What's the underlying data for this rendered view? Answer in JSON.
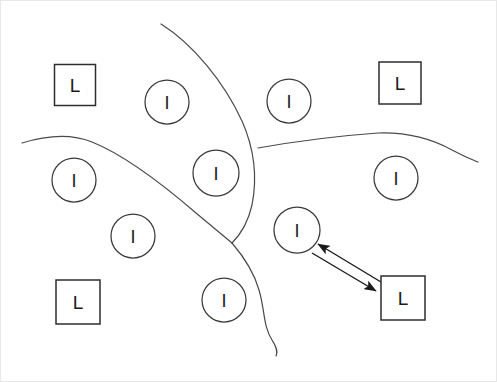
{
  "canvas": {
    "width": 497,
    "height": 382,
    "background": "#ffffff",
    "frame_color": "#e8e8e8",
    "ink_color": "#3a3a3a"
  },
  "diagram": {
    "title": "",
    "type": "hand-drawn-region-map"
  },
  "nodes": [
    {
      "id": "l-top-left",
      "label": "L",
      "shape": "square",
      "cx": 75,
      "cy": 85,
      "size": 41
    },
    {
      "id": "l-top-right",
      "label": "L",
      "shape": "square",
      "cx": 400,
      "cy": 83,
      "size": 42
    },
    {
      "id": "l-bottom-left",
      "label": "L",
      "shape": "square",
      "cx": 78,
      "cy": 302,
      "size": 44
    },
    {
      "id": "l-bottom-right",
      "label": "L",
      "shape": "square",
      "cx": 403,
      "cy": 298,
      "size": 44
    },
    {
      "id": "i-top-left",
      "label": "I",
      "shape": "circle",
      "cx": 167,
      "cy": 102,
      "r": 22
    },
    {
      "id": "i-top-right",
      "label": "I",
      "shape": "circle",
      "cx": 289,
      "cy": 101,
      "r": 22
    },
    {
      "id": "i-center",
      "label": "I",
      "shape": "circle",
      "cx": 216,
      "cy": 173,
      "r": 23
    },
    {
      "id": "i-left",
      "label": "I",
      "shape": "circle",
      "cx": 74,
      "cy": 180,
      "r": 22
    },
    {
      "id": "i-right",
      "label": "I",
      "shape": "circle",
      "cx": 396,
      "cy": 178,
      "r": 22
    },
    {
      "id": "i-mid-left",
      "label": "I",
      "shape": "circle",
      "cx": 133,
      "cy": 236,
      "r": 22
    },
    {
      "id": "i-mid-right",
      "label": "I",
      "shape": "circle",
      "cx": 297,
      "cy": 230,
      "r": 23
    },
    {
      "id": "i-bottom",
      "label": "I",
      "shape": "circle",
      "cx": 224,
      "cy": 300,
      "r": 22
    }
  ],
  "boundaries": [
    {
      "id": "boundary-vertical",
      "path": "M 161 24 C 193 44, 224 82, 242 121 C 253 146, 258 175, 252 205 C 247 227, 238 237, 232 243"
    },
    {
      "id": "boundary-left-diagonal",
      "path": "M 22 143 C 48 135, 72 134, 92 142 C 122 154, 160 182, 196 213 C 214 228, 226 238, 232 243"
    },
    {
      "id": "boundary-right-horizontal",
      "path": "M 258 148 C 292 142, 336 136, 378 133 C 408 132, 432 139, 452 150 C 465 157, 473 160, 478 162"
    },
    {
      "id": "boundary-bottom-tail",
      "path": "M 232 243 C 244 257, 254 272, 259 290 C 265 310, 263 326, 272 340 C 277 348, 278 352, 276 356"
    }
  ],
  "connector": {
    "id": "bidirectional-link",
    "from": "i-mid-right",
    "to": "l-bottom-right",
    "style": "double-arrow-pair",
    "arrow_to_circle": {
      "x1": 381,
      "y1": 282,
      "x2": 318,
      "y2": 244
    },
    "arrow_to_square": {
      "x1": 312,
      "y1": 253,
      "x2": 376,
      "y2": 291
    }
  }
}
